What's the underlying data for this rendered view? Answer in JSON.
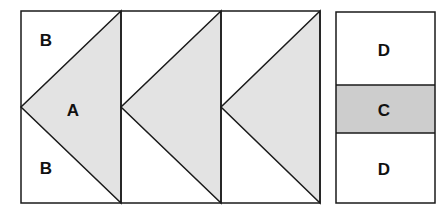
{
  "diagram": {
    "colors": {
      "triangle_fill": "#e3e3e3",
      "band_fill": "#cdcdcd",
      "stroke": "#1a1a1a",
      "background": "#ffffff"
    },
    "geese_units": [
      {
        "triangle_label": "A",
        "top_label": "B",
        "bottom_label": "B"
      },
      {
        "triangle_label": "",
        "top_label": "",
        "bottom_label": ""
      },
      {
        "triangle_label": "",
        "top_label": "",
        "bottom_label": ""
      }
    ],
    "side_strip": {
      "top_label": "D",
      "middle_label": "C",
      "bottom_label": "D"
    }
  }
}
